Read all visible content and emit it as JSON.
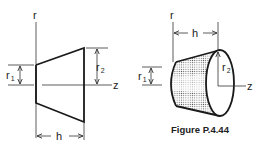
{
  "figure": {
    "caption": "Figure P.4.44",
    "left_view": {
      "axis_r": "r",
      "axis_z": "z",
      "radius_small": {
        "base": "r",
        "sub": "1"
      },
      "radius_large": {
        "base": "r",
        "sub": "2"
      },
      "height": "h"
    },
    "right_view": {
      "axis_r": "r",
      "axis_z": "z",
      "radius_small": {
        "base": "r",
        "sub": "1"
      },
      "radius_large": {
        "base": "r",
        "sub": "2"
      },
      "height": "h"
    }
  }
}
